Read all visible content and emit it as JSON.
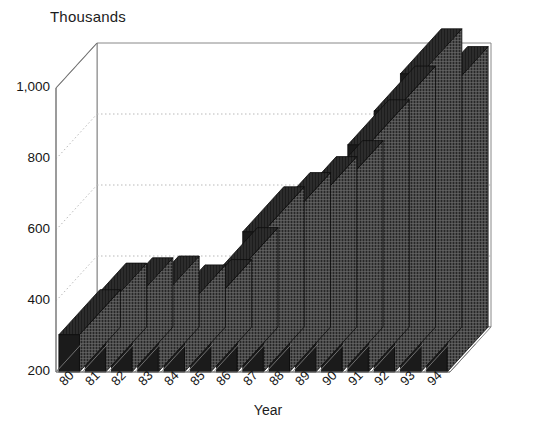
{
  "chart_data": {
    "type": "bar",
    "title": "",
    "ylabel": "Thousands",
    "xlabel": "Year",
    "categories": [
      "80",
      "81",
      "82",
      "83",
      "84",
      "85",
      "86",
      "87",
      "88",
      "89",
      "90",
      "91",
      "92",
      "93",
      "94"
    ],
    "values": [
      305,
      380,
      395,
      400,
      375,
      390,
      480,
      595,
      635,
      680,
      725,
      840,
      935,
      1040,
      990
    ],
    "ylim": [
      200,
      1000
    ],
    "yticks": [
      200,
      400,
      600,
      800,
      1000
    ],
    "ytick_labels": [
      "200",
      "400",
      "600",
      "800",
      "1,000"
    ],
    "grid": true,
    "gridlines_at": [
      400,
      600,
      800
    ],
    "legend": null,
    "style": "3d-column",
    "colors": {
      "bar_front": "#1b1b1b",
      "bar_side": "#4a4a4a",
      "bar_top": "#2c2c2c",
      "axis": "#7a7a7a",
      "grid": "#b9b9b9",
      "background": "#ffffff",
      "text": "#161616"
    }
  },
  "axis_titles": {
    "y": "Thousands",
    "x": "Year"
  }
}
